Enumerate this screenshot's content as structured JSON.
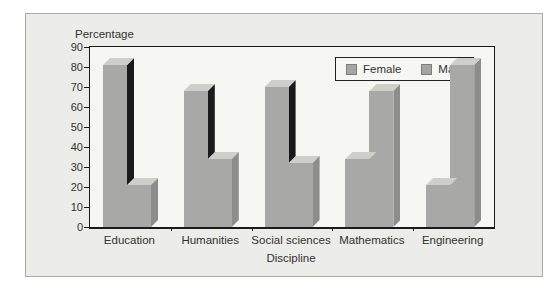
{
  "chart_data": {
    "type": "bar",
    "categories": [
      "Education",
      "Humanities",
      "Social sciences",
      "Mathematics",
      "Engineering"
    ],
    "series": [
      {
        "name": "Female",
        "values": [
          81,
          68,
          70,
          34,
          21
        ]
      },
      {
        "name": "Male",
        "values": [
          21,
          34,
          32,
          68,
          81
        ]
      }
    ],
    "title": "",
    "xlabel": "Discipline",
    "ylabel": "Percentage",
    "ylim": [
      0,
      90
    ],
    "ytick_step": 10,
    "yticks": [
      "0",
      "10",
      "20",
      "30",
      "40",
      "50",
      "60",
      "70",
      "80",
      "90"
    ],
    "grid": false,
    "legend_position": "inside-top-right",
    "bar_style": "3d"
  },
  "colors": {
    "panel_bg": "#ecece8",
    "panel_border": "#a9a9a9",
    "plot_bg": "#f6f6f2",
    "axis": "#1b1b1b",
    "text": "#333333",
    "bar_front": "#a8a8a6",
    "bar_top": "#cfcfca",
    "bar_side_female": "#1a1a1a",
    "bar_side_male": "#8d8d8b",
    "legend_swatch": "#a5a5a3"
  }
}
